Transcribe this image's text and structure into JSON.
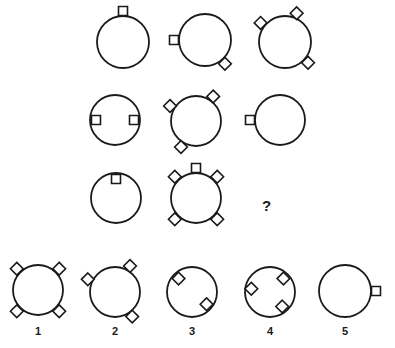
{
  "puzzle": {
    "type": "visual-analogy-matrix",
    "stroke_color": "#1a1a1a",
    "background_color": "#ffffff",
    "question_mark": "?",
    "matrix": {
      "rows": 3,
      "cols": 3,
      "cells": [
        {
          "id": "matrix-cell-r1c1",
          "row": 1,
          "col": 1,
          "cx": 123,
          "cy": 42,
          "r": 26,
          "markers": [
            {
              "shape": "square",
              "angle": 270,
              "placement": "outside",
              "size": 9
            }
          ]
        },
        {
          "id": "matrix-cell-r1c2",
          "row": 1,
          "col": 2,
          "cx": 205,
          "cy": 40,
          "r": 26,
          "markers": [
            {
              "shape": "square",
              "angle": 180,
              "placement": "outside",
              "size": 9
            },
            {
              "shape": "diamond",
              "angle": 50,
              "placement": "outside",
              "size": 9
            }
          ]
        },
        {
          "id": "matrix-cell-r1c3",
          "row": 1,
          "col": 3,
          "cx": 285,
          "cy": 42,
          "r": 26,
          "markers": [
            {
              "shape": "diamond",
              "angle": 292,
              "placement": "outside",
              "size": 9
            },
            {
              "shape": "diamond",
              "angle": 218,
              "placement": "outside",
              "size": 9
            },
            {
              "shape": "diamond",
              "angle": 42,
              "placement": "outside",
              "size": 9
            }
          ]
        },
        {
          "id": "matrix-cell-r2c1",
          "row": 2,
          "col": 1,
          "cx": 115,
          "cy": 120,
          "r": 25,
          "markers": [
            {
              "shape": "square",
              "angle": 180,
              "placement": "inside",
              "size": 9
            },
            {
              "shape": "square",
              "angle": 0,
              "placement": "inside",
              "size": 9
            }
          ]
        },
        {
          "id": "matrix-cell-r2c2",
          "row": 2,
          "col": 2,
          "cx": 196,
          "cy": 121,
          "r": 25,
          "markers": [
            {
              "shape": "diamond",
              "angle": 305,
              "placement": "outside",
              "size": 9
            },
            {
              "shape": "diamond",
              "angle": 210,
              "placement": "outside",
              "size": 9
            },
            {
              "shape": "diamond",
              "angle": 120,
              "placement": "outside",
              "size": 9
            }
          ]
        },
        {
          "id": "matrix-cell-r2c3",
          "row": 2,
          "col": 3,
          "cx": 280,
          "cy": 120,
          "r": 25,
          "markers": [
            {
              "shape": "square",
              "angle": 180,
              "placement": "outside",
              "size": 9
            }
          ]
        },
        {
          "id": "matrix-cell-r3c1",
          "row": 3,
          "col": 1,
          "cx": 116,
          "cy": 198,
          "r": 25,
          "markers": [
            {
              "shape": "square",
              "angle": 270,
              "placement": "inside",
              "size": 9
            }
          ]
        },
        {
          "id": "matrix-cell-r3c2",
          "row": 3,
          "col": 2,
          "cx": 196,
          "cy": 198,
          "r": 25,
          "markers": [
            {
              "shape": "square",
              "angle": 270,
              "placement": "outside",
              "size": 9
            },
            {
              "shape": "diamond",
              "angle": 315,
              "placement": "outside",
              "size": 9
            },
            {
              "shape": "diamond",
              "angle": 225,
              "placement": "outside",
              "size": 9
            },
            {
              "shape": "diamond",
              "angle": 45,
              "placement": "outside",
              "size": 9
            },
            {
              "shape": "diamond",
              "angle": 135,
              "placement": "outside",
              "size": 9
            }
          ]
        },
        {
          "id": "matrix-cell-r3c3",
          "row": 3,
          "col": 3,
          "cx": 267,
          "cy": 207,
          "r": 0,
          "is_missing": true,
          "markers": []
        }
      ]
    },
    "options": [
      {
        "id": "option-1",
        "label": "1",
        "cx": 38,
        "cy": 290,
        "r": 25,
        "label_x": 38,
        "label_y": 332,
        "markers": [
          {
            "shape": "diamond",
            "angle": 315,
            "placement": "outside",
            "size": 9
          },
          {
            "shape": "diamond",
            "angle": 225,
            "placement": "outside",
            "size": 9
          },
          {
            "shape": "diamond",
            "angle": 45,
            "placement": "outside",
            "size": 9
          },
          {
            "shape": "diamond",
            "angle": 135,
            "placement": "outside",
            "size": 9
          }
        ]
      },
      {
        "id": "option-2",
        "label": "2",
        "cx": 115,
        "cy": 292,
        "r": 25,
        "label_x": 115,
        "label_y": 332,
        "markers": [
          {
            "shape": "diamond",
            "angle": 300,
            "placement": "outside",
            "size": 9
          },
          {
            "shape": "diamond",
            "angle": 205,
            "placement": "outside",
            "size": 9
          },
          {
            "shape": "diamond",
            "angle": 55,
            "placement": "outside",
            "size": 9
          }
        ]
      },
      {
        "id": "option-3",
        "label": "3",
        "cx": 192,
        "cy": 292,
        "r": 25,
        "label_x": 192,
        "label_y": 332,
        "markers": [
          {
            "shape": "diamond",
            "angle": 225,
            "placement": "inside",
            "size": 9
          },
          {
            "shape": "diamond",
            "angle": 40,
            "placement": "inside",
            "size": 9
          }
        ]
      },
      {
        "id": "option-4",
        "label": "4",
        "cx": 270,
        "cy": 292,
        "r": 25,
        "label_x": 270,
        "label_y": 332,
        "markers": [
          {
            "shape": "diamond",
            "angle": 315,
            "placement": "inside",
            "size": 9
          },
          {
            "shape": "diamond",
            "angle": 190,
            "placement": "inside",
            "size": 9
          },
          {
            "shape": "diamond",
            "angle": 50,
            "placement": "inside",
            "size": 9
          }
        ]
      },
      {
        "id": "option-5",
        "label": "5",
        "cx": 345,
        "cy": 291,
        "r": 26,
        "label_x": 345,
        "label_y": 332,
        "markers": [
          {
            "shape": "square",
            "angle": 0,
            "placement": "outside",
            "size": 9
          }
        ]
      }
    ]
  }
}
